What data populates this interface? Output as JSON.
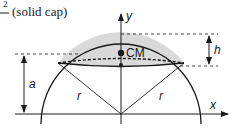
{
  "caption": {
    "superscript": "2",
    "fraction_bar": "—",
    "text": "(solid cap)"
  },
  "axes": {
    "x_label": "x",
    "y_label": "y"
  },
  "labels": {
    "cm": "CM",
    "h": "h",
    "a": "a",
    "r_left": "r",
    "r_right": "r"
  },
  "colors": {
    "cap_fill": "#d9d9d9",
    "stroke": "#1a1a1a",
    "background": "#ffffff"
  }
}
